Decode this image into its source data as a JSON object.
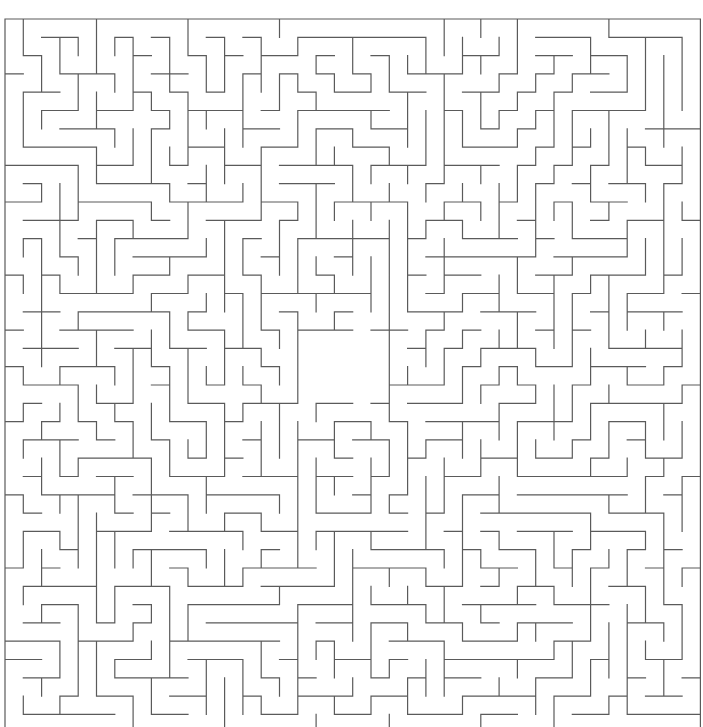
{
  "page": {
    "title_clipped": "fall.",
    "background_color": "#ffffff"
  },
  "maze": {
    "label": "maze-puzzle",
    "wall_color": "#5a5a5a",
    "wall_width": 1.2,
    "background_color": "#ffffff",
    "origin_x": 5,
    "origin_y": 19,
    "cell": 18.3,
    "cols": 38,
    "rows": 39,
    "clipped_bottom": true,
    "chamber": {
      "label": "center-open-chamber",
      "x": 297,
      "y": 337,
      "width": 98,
      "height": 58
    },
    "seed": 20240517
  }
}
